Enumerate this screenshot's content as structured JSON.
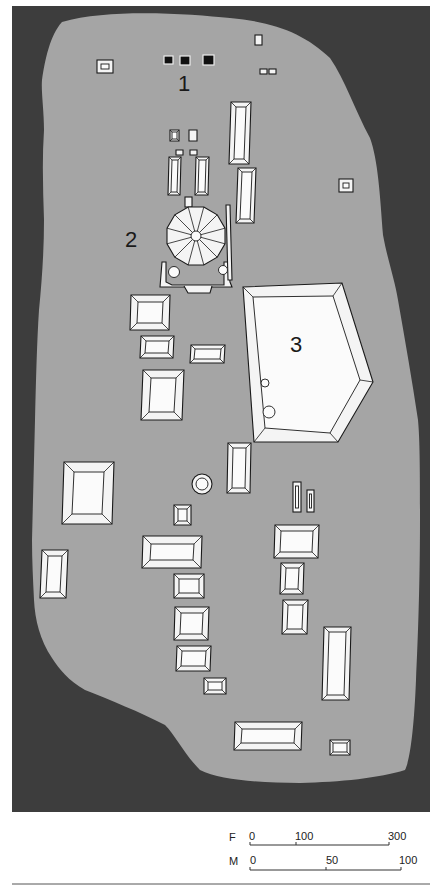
{
  "map": {
    "colors": {
      "background": "#3d3d3d",
      "site": "#a5a5a5",
      "building_fill": "#f4f4f4",
      "building_stroke": "#1a1a1a",
      "marker_dark": "#111111"
    },
    "area_labels": [
      {
        "id": "1",
        "text": "1"
      },
      {
        "id": "2",
        "text": "2"
      },
      {
        "id": "3",
        "text": "3"
      }
    ]
  },
  "scale_bars": [
    {
      "unit_label": "F",
      "ticks": [
        "0",
        "100",
        "300"
      ]
    },
    {
      "unit_label": "M",
      "ticks": [
        "0",
        "50",
        "100"
      ]
    }
  ]
}
